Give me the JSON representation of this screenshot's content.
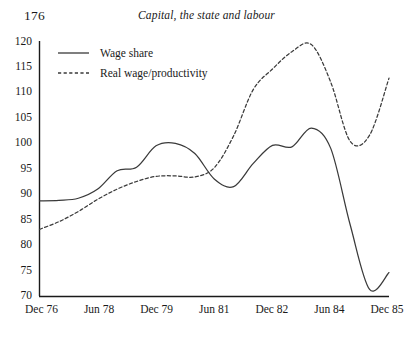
{
  "page": {
    "folio": "176",
    "running_head": "Capital, the state and labour"
  },
  "chart_data": {
    "type": "line",
    "title": "",
    "xlabel": "",
    "ylabel": "",
    "ylim": [
      70,
      120
    ],
    "ytick_labels": [
      "120",
      "115",
      "110",
      "105",
      "100",
      "95",
      "90",
      "85",
      "80",
      "75",
      "70"
    ],
    "ytick_values": [
      120,
      115,
      110,
      105,
      100,
      95,
      90,
      85,
      80,
      75,
      70
    ],
    "xtick_labels": [
      "Dec 76",
      "Jun 78",
      "Dec 79",
      "Jun 81",
      "Dec 82",
      "Jun 84",
      "Dec 85"
    ],
    "x_range_label": [
      "Dec 76",
      "Dec 85"
    ],
    "grid": false,
    "legend_position": "top-left",
    "legend": [
      {
        "name": "Wage share",
        "style": "solid"
      },
      {
        "name": "Real wage/productivity",
        "style": "dashed"
      }
    ],
    "x": [
      "Dec 76",
      "Jun 77",
      "Dec 77",
      "Jun 78",
      "Dec 78",
      "Jun 79",
      "Dec 79",
      "Jun 80",
      "Dec 80",
      "Jun 81",
      "Dec 81",
      "Jun 82",
      "Dec 82",
      "Jun 83",
      "Dec 83",
      "Jun 84",
      "Dec 84",
      "Jun 85",
      "Dec 85"
    ],
    "series": [
      {
        "name": "Wage share",
        "style": "solid",
        "color": "#3a3a3a",
        "values": [
          88.7,
          88.8,
          89.2,
          91.0,
          94.6,
          95.3,
          99.5,
          100.0,
          98.0,
          93.0,
          91.5,
          96.0,
          99.6,
          99.3,
          103.0,
          99.0,
          84.0,
          71.3,
          74.6
        ]
      },
      {
        "name": "Real wage/productivity",
        "style": "dashed",
        "color": "#3a3a3a",
        "values": [
          83.1,
          84.6,
          86.6,
          89.0,
          91.0,
          92.5,
          93.5,
          93.6,
          93.4,
          95.2,
          101.5,
          110.5,
          114.6,
          118.0,
          119.4,
          112.0,
          100.4,
          101.6,
          112.8
        ]
      }
    ]
  }
}
